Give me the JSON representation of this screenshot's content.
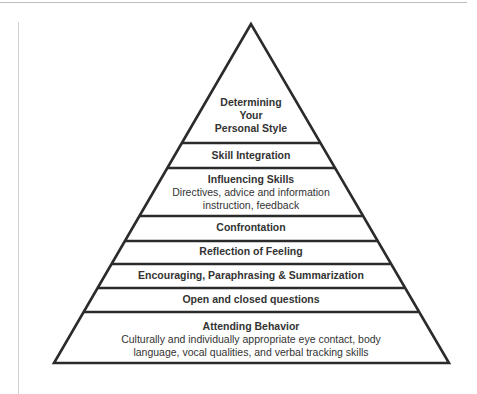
{
  "diagram": {
    "type": "pyramid",
    "colors": {
      "stroke": "#2b2b2b",
      "text": "#333333",
      "rule": "#bdbdbd",
      "background": "#ffffff"
    },
    "levels": [
      {
        "title_lines": [
          "Determining",
          "Your",
          "Personal Style"
        ],
        "description_lines": []
      },
      {
        "title_lines": [
          "Skill Integration"
        ],
        "description_lines": []
      },
      {
        "title_lines": [
          "Influencing Skills"
        ],
        "description_lines": [
          "Directives, advice and information",
          "instruction, feedback"
        ]
      },
      {
        "title_lines": [
          "Confrontation"
        ],
        "description_lines": []
      },
      {
        "title_lines": [
          "Reflection of Feeling"
        ],
        "description_lines": []
      },
      {
        "title_lines": [
          "Encouraging, Paraphrasing & Summarization"
        ],
        "description_lines": []
      },
      {
        "title_lines": [
          "Open and closed questions"
        ],
        "description_lines": []
      },
      {
        "title_lines": [
          "Attending Behavior"
        ],
        "description_lines": [
          "Culturally and individually appropriate eye contact, body",
          "language, vocal qualities, and verbal tracking skills"
        ]
      }
    ]
  }
}
